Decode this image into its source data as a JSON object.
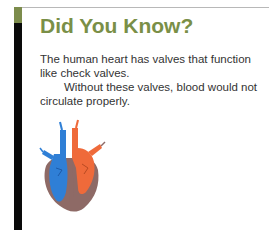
{
  "title": "Did You Know?",
  "paragraphs": [
    "The human heart has valves that function like check valves.",
    "Without these valves, blood would not circulate properly."
  ],
  "illustration": "heart-diagram",
  "colors": {
    "title": "#7a8f47",
    "accent_bar_top": "#7c8c4c",
    "accent_bar": "#0a0a0a",
    "deoxygenated": "#2f7fd6",
    "oxygenated": "#ef6a3a",
    "heart_wall": "#8e6a66"
  }
}
